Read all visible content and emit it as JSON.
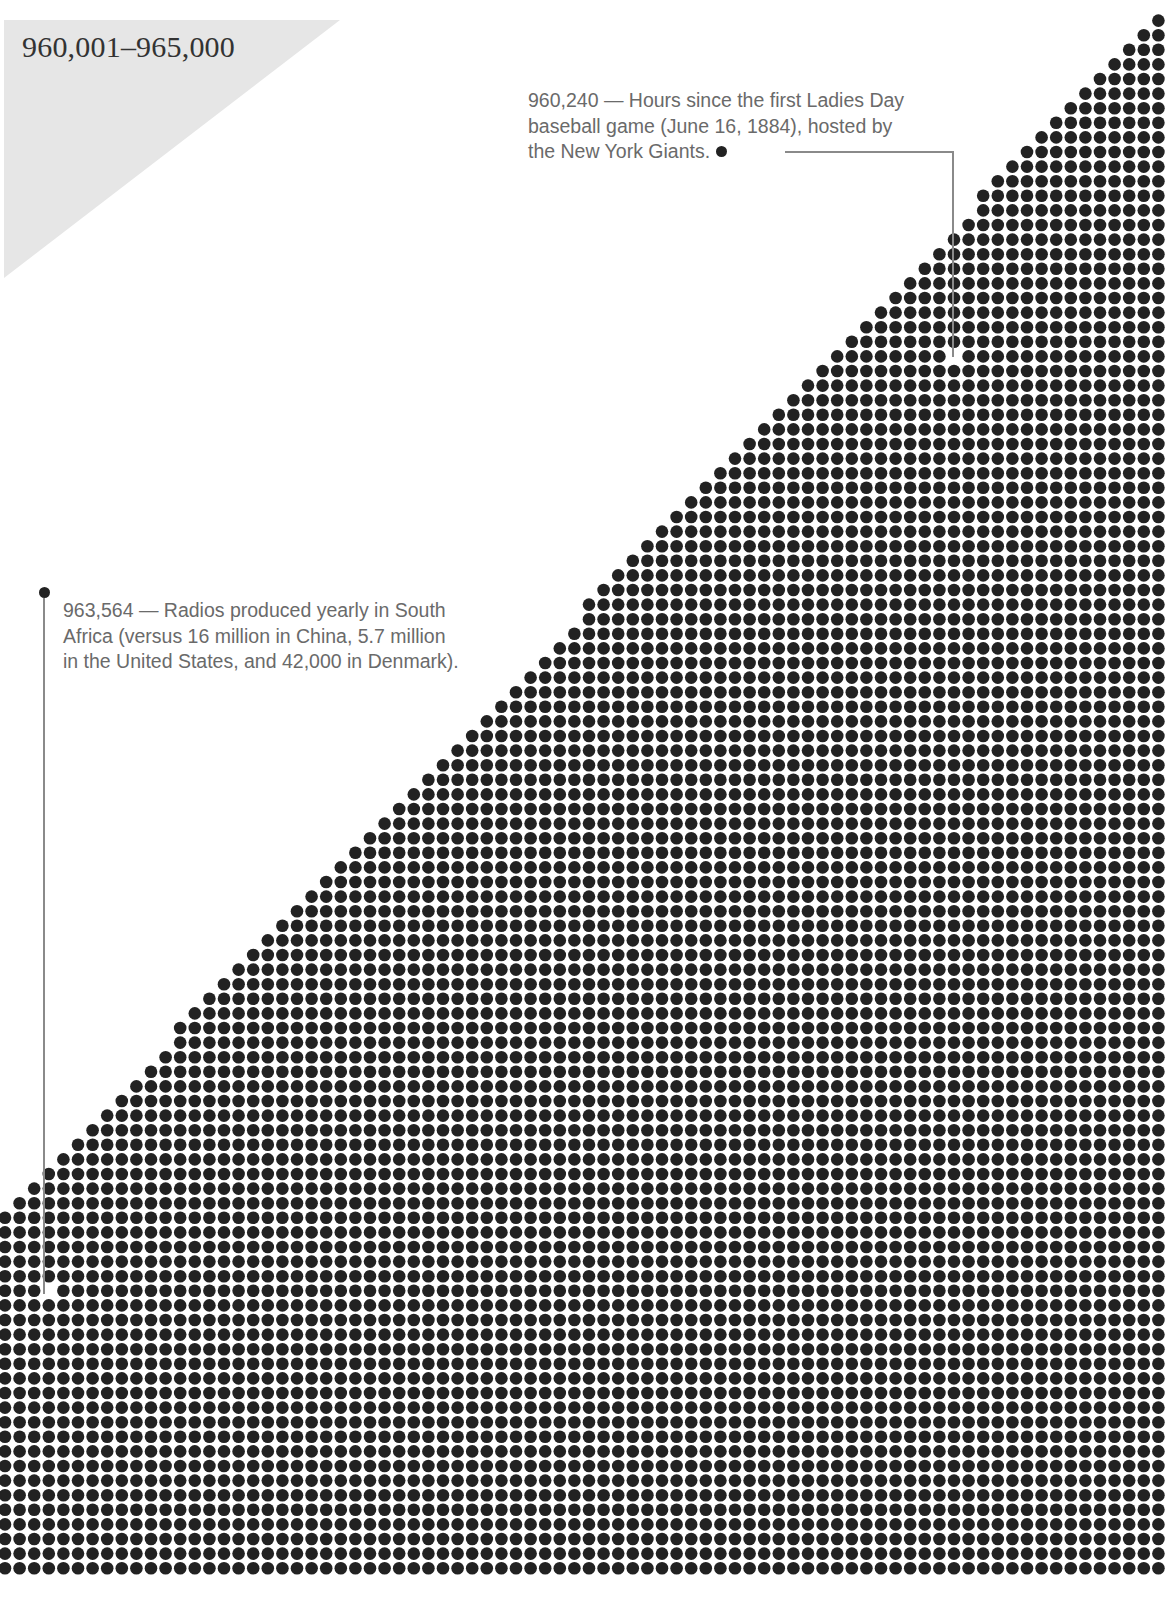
{
  "header": {
    "range_title": "960,001–965,000"
  },
  "annotations": [
    {
      "value": "960,240",
      "lines": [
        "960,240 — Hours since the first Ladies Day",
        "baseball game (June 16, 1884), hosted by",
        "the New York Giants."
      ]
    },
    {
      "value": "963,564",
      "lines": [
        "963,564 — Radios produced yearly in South",
        "Africa (versus 16 million in China, 5.7 million",
        "in the United States, and 42,000 in Denmark)."
      ]
    }
  ],
  "colors": {
    "dot": "#222222",
    "background": "#ffffff",
    "corner_triangle": "#e6e6e6",
    "annotation_text": "#6a6a6a",
    "title_text": "#333333",
    "leader_line": "#8a8a8a"
  },
  "chart_data": {
    "type": "scatter",
    "title": "960,001–965,000",
    "grid": {
      "columns": 80,
      "rows": 108,
      "pitch_px": 14.6
    },
    "range": [
      960001,
      965000
    ],
    "highlighted": [
      {
        "value": 960240,
        "label": "Hours since the first Ladies Day baseball game (June 16, 1884), hosted by the New York Giants."
      },
      {
        "value": 963564,
        "label": "Radios produced yearly in South Africa (versus 16 million in China, 5.7 million in the United States, and 42,000 in Denmark)."
      }
    ]
  }
}
